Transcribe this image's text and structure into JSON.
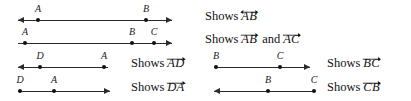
{
  "page": {
    "background_color": "#ffffff",
    "ink_color": "#111111",
    "width": 411,
    "height": 101
  },
  "rows": [
    {
      "id": "row-1",
      "diagram": {
        "name": "line-ab",
        "left_cap": "arrow",
        "right_cap": "arrow",
        "points": [
          {
            "label": "A",
            "x": 38
          },
          {
            "label": "B",
            "x": 166
          }
        ]
      },
      "caption": {
        "prefix": "Shows",
        "terms": [
          {
            "letters": "AB",
            "accent": "double-arrow"
          }
        ],
        "conjunction": ""
      }
    },
    {
      "id": "row-2",
      "diagram": {
        "name": "ray-ab-ac",
        "left_cap": "none",
        "right_cap": "arrow",
        "points": [
          {
            "label": "A",
            "x": 25
          },
          {
            "label": "B",
            "x": 152
          },
          {
            "label": "C",
            "x": 166
          }
        ]
      },
      "caption": {
        "prefix": "Shows",
        "terms": [
          {
            "letters": "AB",
            "accent": "right-arrow"
          },
          {
            "letters": "AC",
            "accent": "right-arrow"
          }
        ],
        "conjunction": "and"
      }
    },
    {
      "id": "row-3-left",
      "diagram": {
        "name": "ray-ad",
        "left_cap": "arrow",
        "right_cap": "none",
        "points": [
          {
            "label": "D",
            "x": 40
          },
          {
            "label": "A",
            "x": 104
          }
        ]
      },
      "caption": {
        "prefix": "Shows",
        "terms": [
          {
            "letters": "AD",
            "accent": "right-arrow"
          }
        ],
        "conjunction": ""
      }
    },
    {
      "id": "row-3-right",
      "diagram": {
        "name": "ray-bc",
        "left_cap": "none",
        "right_cap": "arrow",
        "points": [
          {
            "label": "B",
            "x": 22
          },
          {
            "label": "C",
            "x": 86
          }
        ]
      },
      "caption": {
        "prefix": "Shows",
        "terms": [
          {
            "letters": "BC",
            "accent": "right-arrow"
          }
        ],
        "conjunction": ""
      }
    },
    {
      "id": "row-4-left",
      "diagram": {
        "name": "ray-da",
        "left_cap": "none",
        "right_cap": "arrow",
        "points": [
          {
            "label": "D",
            "x": 22
          },
          {
            "label": "A",
            "x": 56
          }
        ]
      },
      "caption": {
        "prefix": "Shows",
        "terms": [
          {
            "letters": "DA",
            "accent": "right-arrow"
          }
        ],
        "conjunction": ""
      }
    },
    {
      "id": "row-4-right",
      "diagram": {
        "name": "ray-cb",
        "left_cap": "arrow",
        "right_cap": "none",
        "points": [
          {
            "label": "B",
            "x": 54
          },
          {
            "label": "C",
            "x": 100
          }
        ]
      },
      "caption": {
        "prefix": "Shows",
        "terms": [
          {
            "letters": "CB",
            "accent": "right-arrow"
          }
        ],
        "conjunction": ""
      }
    }
  ],
  "labels": {
    "r1_A": "A",
    "r1_B": "B",
    "r2_A": "A",
    "r2_B": "B",
    "r2_C": "C",
    "r3l_D": "D",
    "r3l_A": "A",
    "r3r_B": "B",
    "r3r_C": "C",
    "r4l_D": "D",
    "r4l_A": "A",
    "r4r_B": "B",
    "r4r_C": "C"
  },
  "captions": {
    "r1_prefix": "Shows",
    "r1_term1": "AB",
    "r2_prefix": "Shows",
    "r2_term1": "AB",
    "r2_and": "and",
    "r2_term2": "AC",
    "r3l_prefix": "Shows",
    "r3l_term1": "AD",
    "r3r_prefix": "Shows",
    "r3r_term1": "BC",
    "r4l_prefix": "Shows",
    "r4l_term1": "DA",
    "r4r_prefix": "Shows",
    "r4r_term1": "CB"
  }
}
